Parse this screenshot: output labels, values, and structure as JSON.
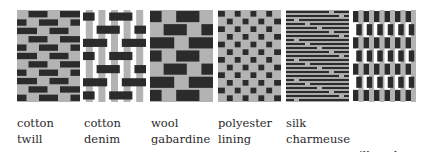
{
  "colors": {
    "weft_dark": "#2b2b2b",
    "warp_gray": "#b3b3b3",
    "background": "#ffffff"
  },
  "fabrics": [
    {
      "id": "cotton-twill",
      "line1": "cotton",
      "line2": "twill",
      "x": 17,
      "label_x": 17,
      "pattern": "twill"
    },
    {
      "id": "cotton-denim",
      "line1": "cotton",
      "line2": "denim",
      "x": 83,
      "label_x": 84,
      "pattern": "denim"
    },
    {
      "id": "wool-gabardine",
      "line1": "wool",
      "line2": "gabardine",
      "x": 150,
      "label_x": 151,
      "pattern": "gabardine"
    },
    {
      "id": "polyester-lining",
      "line1": "polyester",
      "line2": "lining",
      "x": 218,
      "label_x": 218,
      "pattern": "plain"
    },
    {
      "id": "silk-charmeuse",
      "line1": "silk",
      "line2": "charmeuse",
      "x": 286,
      "label_x": 286,
      "pattern": "satin"
    },
    {
      "id": "silk-shantung",
      "line1": "silk    shan-",
      "line2": "tung",
      "x": 353,
      "label_x": 353,
      "pattern": "shantung"
    }
  ]
}
